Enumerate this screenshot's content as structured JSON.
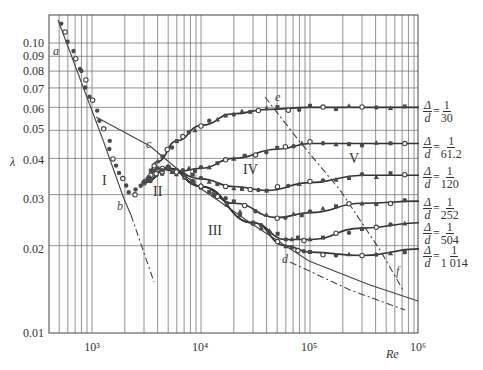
{
  "chart_data": {
    "type": "line",
    "title": "",
    "xlabel": "Re",
    "ylabel": "λ",
    "xscale": "log",
    "yscale": "log",
    "xlim": [
      400,
      1000000
    ],
    "ylim": [
      0.01,
      0.13
    ],
    "grid": true,
    "x_tick_labels": [
      "10³",
      "10⁴",
      "10⁵",
      "10⁶"
    ],
    "x_ticks": [
      1000,
      10000,
      100000,
      1000000
    ],
    "y_tick_labels": [
      "0.01",
      "0.02",
      "0.03",
      "0.04",
      "0.05",
      "0.06",
      "0.07",
      "0.08",
      "0.09",
      "0.10"
    ],
    "y_ticks": [
      0.01,
      0.02,
      0.03,
      0.04,
      0.05,
      0.06,
      0.07,
      0.08,
      0.09,
      0.1
    ],
    "regions": [
      "I",
      "II",
      "III",
      "IV",
      "V"
    ],
    "point_labels": [
      "a",
      "b",
      "c",
      "d",
      "e",
      "f"
    ],
    "reference_lines": [
      {
        "name": "laminar (64/Re)",
        "x": [
          450,
          2300,
          4000
        ],
        "y": [
          0.142,
          0.0278,
          0.016
        ]
      },
      {
        "name": "Blasius smooth pipe",
        "x": [
          1000,
          10000,
          100000,
          1000000
        ],
        "y": [
          0.0563,
          0.0316,
          0.0178,
          0.01
        ]
      },
      {
        "name": "transition c-e-f",
        "x": [
          4000,
          45000,
          900000
        ],
        "y": [
          0.042,
          0.065,
          0.017
        ]
      }
    ],
    "series": [
      {
        "name": "Δ/d = 1/30",
        "legend": {
          "num": "1",
          "den": "30"
        },
        "x": [
          3000,
          4000,
          6000,
          10000,
          20000,
          40000,
          100000,
          300000,
          1000000
        ],
        "y": [
          0.033,
          0.039,
          0.046,
          0.052,
          0.057,
          0.059,
          0.06,
          0.06,
          0.06
        ]
      },
      {
        "name": "Δ/d = 1/61.2",
        "legend": {
          "num": "1",
          "den": "61.2"
        },
        "x": [
          3000,
          4000,
          6000,
          10000,
          20000,
          50000,
          100000,
          300000,
          1000000
        ],
        "y": [
          0.033,
          0.037,
          0.036,
          0.037,
          0.04,
          0.043,
          0.045,
          0.045,
          0.045
        ]
      },
      {
        "name": "Δ/d = 1/120",
        "legend": {
          "num": "1",
          "den": "120"
        },
        "x": [
          3000,
          5000,
          10000,
          20000,
          40000,
          100000,
          300000,
          1000000
        ],
        "y": [
          0.033,
          0.037,
          0.034,
          0.032,
          0.031,
          0.033,
          0.035,
          0.035
        ]
      },
      {
        "name": "Δ/d = 1/252",
        "legend": {
          "num": "1",
          "den": "252"
        },
        "x": [
          3000,
          5000,
          10000,
          20000,
          50000,
          100000,
          300000,
          1000000
        ],
        "y": [
          0.033,
          0.037,
          0.032,
          0.028,
          0.025,
          0.026,
          0.028,
          0.0285
        ]
      },
      {
        "name": "Δ/d = 1/504",
        "legend": {
          "num": "1",
          "den": "504"
        },
        "x": [
          3000,
          5000,
          10000,
          30000,
          60000,
          100000,
          300000,
          1000000
        ],
        "y": [
          0.033,
          0.037,
          0.032,
          0.024,
          0.021,
          0.021,
          0.023,
          0.024
        ]
      },
      {
        "name": "Δ/d = 1/1014",
        "legend": {
          "num": "1",
          "den": "1 014"
        },
        "x": [
          3000,
          5000,
          10000,
          30000,
          60000,
          100000,
          300000,
          1000000
        ],
        "y": [
          0.033,
          0.037,
          0.032,
          0.024,
          0.02,
          0.019,
          0.0185,
          0.0195
        ]
      }
    ]
  },
  "labels": {
    "y_axis": "λ",
    "x_axis": "Re",
    "x_ticks": [
      "10³",
      "10⁴",
      "10⁵",
      "10⁶"
    ],
    "y_ticks": [
      "0.10",
      "0.09",
      "0.08",
      "0.07",
      "0.06",
      "0.05",
      "0.04",
      "0.03",
      "0.02",
      "0.01"
    ],
    "regions": {
      "r1": "I",
      "r2": "II",
      "r3": "III",
      "r4": "IV",
      "r5": "V"
    },
    "points": {
      "a": "a",
      "b": "b",
      "c": "c",
      "d": "d",
      "e": "e",
      "f": "f"
    },
    "legend_symbol_num": "Δ",
    "legend_symbol_den": "d",
    "legend_eq": "=",
    "legend": [
      {
        "num": "1",
        "den": "30"
      },
      {
        "num": "1",
        "den": "61.2"
      },
      {
        "num": "1",
        "den": "120"
      },
      {
        "num": "1",
        "den": "252"
      },
      {
        "num": "1",
        "den": "504"
      },
      {
        "num": "1",
        "den": "1 014"
      }
    ]
  }
}
